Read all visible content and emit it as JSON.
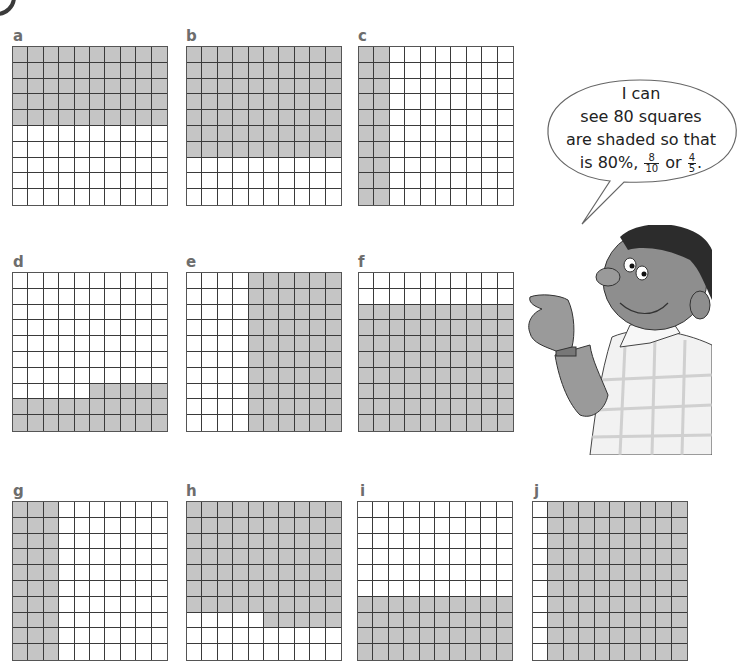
{
  "colors": {
    "shaded": "#c5c5c5",
    "grid_line": "#3a3a3a",
    "label": "#6d6d6d",
    "background": "#ffffff"
  },
  "grids": [
    {
      "label": "a",
      "shaded_count": 50,
      "pattern": "top 5 rows shaded"
    },
    {
      "label": "b",
      "shaded_count": 70,
      "pattern": "top 7 rows shaded"
    },
    {
      "label": "c",
      "shaded_count": 20,
      "pattern": "left 2 columns shaded"
    },
    {
      "label": "d",
      "shaded_count": 25,
      "pattern": "bottom 2 rows plus right 5 cells of row 8 shaded"
    },
    {
      "label": "e",
      "shaded_count": 60,
      "pattern": "right 6 columns shaded"
    },
    {
      "label": "f",
      "shaded_count": 80,
      "pattern": "bottom 8 rows shaded"
    },
    {
      "label": "g",
      "shaded_count": 30,
      "pattern": "left 3 columns shaded"
    },
    {
      "label": "h",
      "shaded_count": 75,
      "pattern": "top 7 rows plus right 5 cells of row 8 shaded"
    },
    {
      "label": "i",
      "shaded_count": 40,
      "pattern": "bottom 4 rows shaded"
    },
    {
      "label": "j",
      "shaded_count": 90,
      "pattern": "right 9 columns shaded"
    }
  ],
  "speech_bubble": {
    "line1": "I can",
    "line2": "see 80 squares",
    "line3": "are shaded so that",
    "line4_prefix": "is 80%,",
    "frac1_num": "8",
    "frac1_den": "10",
    "or_word": "or",
    "frac2_num": "4",
    "frac2_den": "5",
    "suffix": "."
  },
  "illustration": {
    "subject": "boy pointing with finger, wearing checked shirt and wristwatch"
  }
}
